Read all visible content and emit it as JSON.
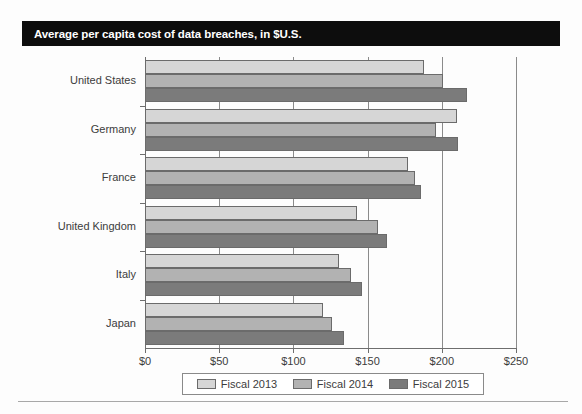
{
  "title": "Average per capita cost of data breaches, in $U.S.",
  "chart_data": {
    "type": "bar",
    "orientation": "horizontal",
    "title": "Average per capita cost of data breaches, in $U.S.",
    "xlabel": "",
    "ylabel": "",
    "xlim": [
      0,
      250
    ],
    "xticks": [
      0,
      50,
      100,
      150,
      200,
      250
    ],
    "xtick_labels": [
      "$0",
      "$50",
      "$100",
      "$150",
      "$200",
      "$250"
    ],
    "grid": true,
    "legend_position": "bottom",
    "categories": [
      "United States",
      "Germany",
      "France",
      "United Kingdom",
      "Italy",
      "Japan"
    ],
    "series": [
      {
        "name": "Fiscal 2013",
        "color": "#d6d6d6",
        "values": [
          188,
          210,
          177,
          143,
          131,
          120
        ]
      },
      {
        "name": "Fiscal 2014",
        "color": "#b2b2b2",
        "values": [
          201,
          196,
          182,
          157,
          139,
          126
        ]
      },
      {
        "name": "Fiscal 2015",
        "color": "#7b7b7b",
        "values": [
          217,
          211,
          186,
          163,
          146,
          134
        ]
      }
    ]
  },
  "legend": {
    "entries": [
      {
        "label": "Fiscal 2013",
        "color": "#d6d6d6"
      },
      {
        "label": "Fiscal 2014",
        "color": "#b2b2b2"
      },
      {
        "label": "Fiscal 2015",
        "color": "#7b7b7b"
      }
    ]
  },
  "colors": {
    "banner_background": "#0d0d0d",
    "banner_text": "#ffffff",
    "axis": "#6e6e6e",
    "gridline": "#8b8b8b",
    "bar_outline": "#6b6b6b",
    "label_text": "#3c3c3c"
  }
}
